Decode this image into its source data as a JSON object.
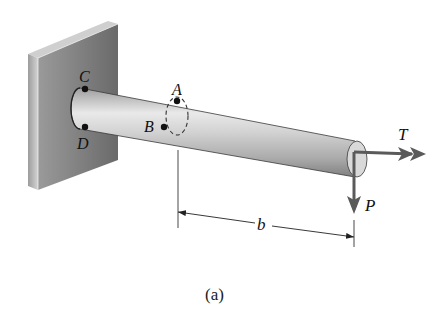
{
  "figure": {
    "caption": "(a)",
    "points": {
      "C": "C",
      "D": "D",
      "A": "A",
      "B": "B"
    },
    "loads": {
      "torque": "T",
      "force": "P"
    },
    "dimension": {
      "label": "b",
      "from": "section at A/B",
      "to": "free end (line of action of P)"
    }
  },
  "colors": {
    "wall_face": "#7a7a7a",
    "wall_side": "#bdbdbd",
    "bar_light": "#e6e6e6",
    "bar_dark": "#8d8d8d",
    "arrow": "#5a5a5a",
    "ink": "#111111"
  }
}
